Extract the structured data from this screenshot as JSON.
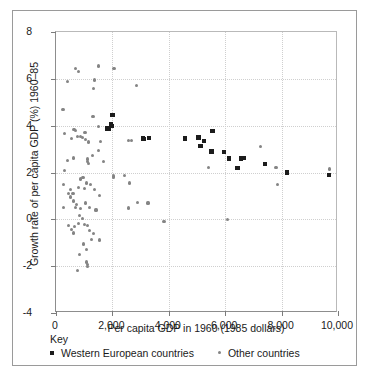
{
  "chart_data": {
    "type": "scatter",
    "title": "",
    "xlabel": "Per capita GDP in 1960 (1985 dollars)",
    "ylabel": "Growth rate of per capita GDP (%) 1960–85",
    "xlim": [
      0,
      10000
    ],
    "ylim": [
      -4,
      8
    ],
    "xticks": [
      0,
      2000,
      4000,
      6000,
      8000,
      10000
    ],
    "xticklabels": [
      "0",
      "2,000",
      "4,000",
      "6,000",
      "8,000",
      "10,000"
    ],
    "yticks": [
      -4,
      -2,
      0,
      2,
      4,
      6,
      8
    ],
    "yticklabels": [
      "-4",
      "-2",
      "0",
      "2",
      "4",
      "6",
      "8"
    ],
    "grid": true,
    "legend_position": "below-axes",
    "legend_title": "Key",
    "series": [
      {
        "name": "Western European countries",
        "marker": "square",
        "color": "#1c1c1c",
        "points": [
          [
            2010,
            4.45
          ],
          [
            1960,
            4.05
          ],
          [
            1980,
            3.98
          ],
          [
            1830,
            3.88
          ],
          [
            1870,
            3.85
          ],
          [
            3080,
            3.45
          ],
          [
            3130,
            3.42
          ],
          [
            3300,
            3.48
          ],
          [
            4580,
            3.45
          ],
          [
            5060,
            3.5
          ],
          [
            5120,
            3.12
          ],
          [
            5250,
            3.35
          ],
          [
            5550,
            3.78
          ],
          [
            5520,
            2.9
          ],
          [
            5960,
            2.88
          ],
          [
            6130,
            2.6
          ],
          [
            6430,
            2.2
          ],
          [
            6560,
            2.6
          ],
          [
            6660,
            2.62
          ],
          [
            7420,
            2.35
          ],
          [
            8200,
            2.0
          ],
          [
            9680,
            1.9
          ]
        ]
      },
      {
        "name": "Other countries",
        "marker": "circle",
        "color": "#848484",
        "points": [
          [
            700,
            6.45
          ],
          [
            1520,
            6.55
          ],
          [
            2060,
            6.45
          ],
          [
            810,
            6.3
          ],
          [
            400,
            5.88
          ],
          [
            1370,
            5.95
          ],
          [
            1330,
            5.58
          ],
          [
            2850,
            5.72
          ],
          [
            250,
            4.7
          ],
          [
            1310,
            4.38
          ],
          [
            1510,
            3.98
          ],
          [
            1030,
            3.7
          ],
          [
            300,
            3.65
          ],
          [
            640,
            3.82
          ],
          [
            700,
            3.78
          ],
          [
            540,
            3.45
          ],
          [
            760,
            3.52
          ],
          [
            870,
            3.55
          ],
          [
            940,
            3.5
          ],
          [
            1040,
            3.42
          ],
          [
            1150,
            3.3
          ],
          [
            1580,
            3.32
          ],
          [
            2560,
            3.38
          ],
          [
            2680,
            3.35
          ],
          [
            1520,
            2.95
          ],
          [
            1290,
            2.72
          ],
          [
            1120,
            2.58
          ],
          [
            1110,
            2.48
          ],
          [
            1160,
            2.4
          ],
          [
            420,
            2.5
          ],
          [
            630,
            2.62
          ],
          [
            300,
            2.08
          ],
          [
            2030,
            1.85
          ],
          [
            2040,
            1.78
          ],
          [
            2430,
            1.88
          ],
          [
            5420,
            2.22
          ],
          [
            7250,
            3.1
          ],
          [
            7800,
            2.22
          ],
          [
            9700,
            2.15
          ],
          [
            7860,
            1.48
          ],
          [
            260,
            1.48
          ],
          [
            500,
            1.28
          ],
          [
            430,
            1.12
          ],
          [
            600,
            1.1
          ],
          [
            860,
            1.72
          ],
          [
            960,
            1.78
          ],
          [
            1080,
            1.55
          ],
          [
            1230,
            1.5
          ],
          [
            1360,
            1.28
          ],
          [
            1010,
            1.3
          ],
          [
            790,
            1.35
          ],
          [
            520,
            0.95
          ],
          [
            610,
            0.78
          ],
          [
            730,
            0.62
          ],
          [
            690,
            0.52
          ],
          [
            280,
            0.52
          ],
          [
            880,
            0.45
          ],
          [
            1060,
            0.7
          ],
          [
            1190,
            0.52
          ],
          [
            1420,
            0.4
          ],
          [
            1530,
            1.02
          ],
          [
            2580,
            0.48
          ],
          [
            2890,
            0.72
          ],
          [
            3260,
            0.7
          ],
          [
            2620,
            1.55
          ],
          [
            840,
            0.18
          ],
          [
            950,
            0.05
          ],
          [
            430,
            -0.28
          ],
          [
            540,
            -0.42
          ],
          [
            660,
            -0.3
          ],
          [
            790,
            -0.18
          ],
          [
            1010,
            -0.22
          ],
          [
            1130,
            -0.25
          ],
          [
            1180,
            -0.48
          ],
          [
            620,
            -0.58
          ],
          [
            1330,
            -0.62
          ],
          [
            1250,
            -0.85
          ],
          [
            1550,
            -0.88
          ],
          [
            980,
            -1.05
          ],
          [
            1080,
            -1.28
          ],
          [
            830,
            -1.5
          ],
          [
            1090,
            -1.82
          ],
          [
            1120,
            -1.92
          ],
          [
            1130,
            -2.02
          ],
          [
            770,
            -2.18
          ],
          [
            3830,
            -0.1
          ],
          [
            6080,
            -0.02
          ],
          [
            6560,
            2.62
          ],
          [
            1690,
            2.48
          ]
        ]
      }
    ]
  },
  "legend": {
    "title": "Key",
    "entries": [
      {
        "label": "Western European countries",
        "marker": "square"
      },
      {
        "label": "Other countries",
        "marker": "circle"
      }
    ]
  }
}
